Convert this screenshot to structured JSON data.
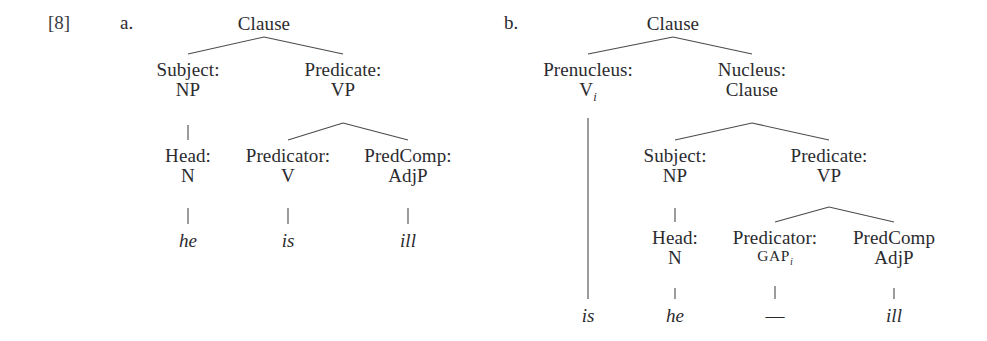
{
  "example": {
    "number": "[8]",
    "number_x": 48,
    "number_y": 12
  },
  "colors": {
    "text": "#2b2b2f",
    "line": "#4a4a50",
    "background": "#ffffff"
  },
  "trees": [
    {
      "letter": "a.",
      "letter_x": 120,
      "letter_y": 12,
      "sentence": "he is ill",
      "nodes": [
        {
          "name": "clause-root",
          "role": "",
          "category": "Clause",
          "x": 264,
          "y": 14
        },
        {
          "name": "subject-np",
          "role": "Subject:",
          "category": "NP",
          "x": 188,
          "y": 60
        },
        {
          "name": "predicate-vp",
          "role": "Predicate:",
          "category": "VP",
          "x": 343,
          "y": 60
        },
        {
          "name": "head-n",
          "role": "Head:",
          "category": "N",
          "x": 188,
          "y": 146
        },
        {
          "name": "predicator-v",
          "role": "Predicator:",
          "category": "V",
          "x": 288,
          "y": 146
        },
        {
          "name": "predcomp-adjp",
          "role": "PredComp:",
          "category": "AdjP",
          "x": 408,
          "y": 146
        }
      ],
      "leaves": [
        {
          "name": "leaf-he",
          "text": "he",
          "x": 188,
          "y": 230
        },
        {
          "name": "leaf-is",
          "text": "is",
          "x": 288,
          "y": 230
        },
        {
          "name": "leaf-ill",
          "text": "ill",
          "x": 408,
          "y": 230
        }
      ],
      "edges": [
        {
          "x1": 264,
          "y1": 37,
          "x2": 188,
          "y2": 54
        },
        {
          "x1": 264,
          "y1": 37,
          "x2": 343,
          "y2": 54
        },
        {
          "x1": 188,
          "y1": 125,
          "x2": 188,
          "y2": 140
        },
        {
          "x1": 343,
          "y1": 123,
          "x2": 288,
          "y2": 140
        },
        {
          "x1": 343,
          "y1": 123,
          "x2": 408,
          "y2": 140
        },
        {
          "x1": 188,
          "y1": 208,
          "x2": 188,
          "y2": 224
        },
        {
          "x1": 288,
          "y1": 208,
          "x2": 288,
          "y2": 224
        },
        {
          "x1": 408,
          "y1": 208,
          "x2": 408,
          "y2": 224
        }
      ]
    },
    {
      "letter": "b.",
      "letter_x": 504,
      "letter_y": 12,
      "sentence": "is he ill",
      "nodes": [
        {
          "name": "clause-root",
          "role": "",
          "category": "Clause",
          "x": 673,
          "y": 14
        },
        {
          "name": "prenucleus-v",
          "role": "Prenucleus:",
          "category": "V",
          "subscript": "i",
          "x": 588,
          "y": 60
        },
        {
          "name": "nucleus-clause",
          "role": "Nucleus:",
          "category": "Clause",
          "x": 752,
          "y": 60
        },
        {
          "name": "subject-np",
          "role": "Subject:",
          "category": "NP",
          "x": 675,
          "y": 146
        },
        {
          "name": "predicate-vp",
          "role": "Predicate:",
          "category": "VP",
          "x": 829,
          "y": 146
        },
        {
          "name": "head-n",
          "role": "Head:",
          "category": "N",
          "x": 675,
          "y": 228
        },
        {
          "name": "predicator-gap",
          "role": "Predicator:",
          "category": "GAP",
          "subscript": "i",
          "smallcaps": true,
          "x": 775,
          "y": 228
        },
        {
          "name": "predcomp-adjp",
          "role": "PredComp",
          "category": "AdjP",
          "x": 894,
          "y": 228
        }
      ],
      "leaves": [
        {
          "name": "leaf-is",
          "text": "is",
          "x": 588,
          "y": 305
        },
        {
          "name": "leaf-he",
          "text": "he",
          "x": 675,
          "y": 305
        },
        {
          "name": "leaf-gap",
          "text": "—",
          "x": 775,
          "y": 305
        },
        {
          "name": "leaf-ill",
          "text": "ill",
          "x": 894,
          "y": 305
        }
      ],
      "edges": [
        {
          "x1": 673,
          "y1": 37,
          "x2": 588,
          "y2": 54
        },
        {
          "x1": 673,
          "y1": 37,
          "x2": 752,
          "y2": 54
        },
        {
          "x1": 588,
          "y1": 118,
          "x2": 588,
          "y2": 299
        },
        {
          "x1": 752,
          "y1": 123,
          "x2": 675,
          "y2": 140
        },
        {
          "x1": 752,
          "y1": 123,
          "x2": 829,
          "y2": 140
        },
        {
          "x1": 675,
          "y1": 208,
          "x2": 675,
          "y2": 222
        },
        {
          "x1": 829,
          "y1": 207,
          "x2": 775,
          "y2": 222
        },
        {
          "x1": 829,
          "y1": 207,
          "x2": 894,
          "y2": 222
        },
        {
          "x1": 675,
          "y1": 288,
          "x2": 675,
          "y2": 299
        },
        {
          "x1": 775,
          "y1": 286,
          "x2": 775,
          "y2": 299
        },
        {
          "x1": 894,
          "y1": 288,
          "x2": 894,
          "y2": 299
        }
      ]
    }
  ]
}
